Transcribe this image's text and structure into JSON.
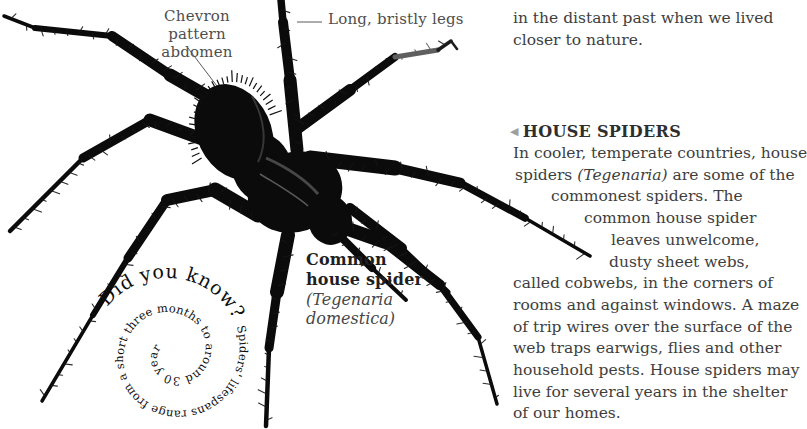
{
  "labels": {
    "chevron_line1": "Chevron pattern",
    "chevron_line2": "abdomen",
    "legs": "Long, bristly legs"
  },
  "caption": {
    "line1": "Common",
    "line2": "house spider",
    "line3": "(Tegenaria",
    "line4": "domestica)"
  },
  "spiral": {
    "big": "Did you know? ",
    "rest": "Spiders' lifespans range from a short three months to around 30 years."
  },
  "column": {
    "para1": {
      "l1": "in the distant past when we lived",
      "l2": "closer to nature."
    },
    "heading": {
      "arrow": "◀",
      "text": "HOUSE SPIDERS"
    },
    "para2": {
      "l1": "In cooler, temperate countries, house",
      "l2pre": "spiders ",
      "l2it": "(Tegenaria)",
      "l2post": " are some of the",
      "l3": "commonest spiders. The",
      "l4": "common house spider",
      "l5": "leaves unwelcome,",
      "l6": "dusty sheet webs,",
      "l7": "called cobwebs, in the corners of",
      "l8": "rooms and against windows. A maze",
      "l9": "of trip wires over the surface of the",
      "l10": "web traps earwigs, flies and other",
      "l11": "household pests. House spiders may",
      "l12": "live for several years in the shelter",
      "l13": "of our homes."
    }
  },
  "colors": {
    "body_text": "#3e3e3e",
    "label_text": "#4e4e4e",
    "heading_arrow": "#9e9e9e",
    "spider_ink": "#0b0b0b"
  },
  "image_alt": "Black cut-out photograph of a common house spider with long bristly legs"
}
